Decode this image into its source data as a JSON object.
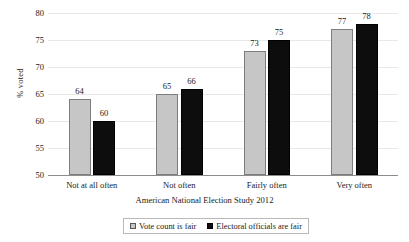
{
  "chart_data": {
    "type": "bar",
    "title": "",
    "xlabel": "American National Election Study 2012",
    "ylabel": "% voted",
    "categories": [
      "Not at all often",
      "Not often",
      "Fairly often",
      "Very often"
    ],
    "series": [
      {
        "name": "Vote count is fair",
        "values": [
          64,
          65,
          73,
          77
        ],
        "color": "#c6c6c6"
      },
      {
        "name": "Electoral officials are fair",
        "values": [
          60,
          66,
          75,
          78
        ],
        "color": "#0d0d0d"
      }
    ],
    "ylim": [
      50,
      80
    ],
    "yticks": [
      50,
      55,
      60,
      65,
      70,
      75,
      80
    ],
    "ytick_labels": [
      "50",
      "55",
      "60",
      "65",
      "70",
      "75",
      "80"
    ],
    "grid": true,
    "legend_position": "bottom",
    "value_labels": true
  },
  "axes": {
    "y_title": "% voted",
    "x_title": "American National Election Study 2012"
  },
  "legend": {
    "entries": [
      {
        "label": "Vote count is fair",
        "swatch": "series-a-swatch"
      },
      {
        "label": "Electoral officials are fair",
        "swatch": "series-b-swatch"
      }
    ]
  }
}
